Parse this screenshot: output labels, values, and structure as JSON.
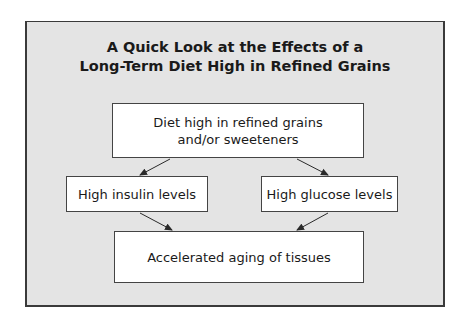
{
  "title": {
    "line1": "A Quick Look at the Effects of a",
    "line2": "Long-Term Diet High in Refined Grains"
  },
  "nodes": {
    "top": {
      "line1": "Diet high in refined grains",
      "line2": "and/or sweeteners"
    },
    "insulin": {
      "label": "High insulin levels"
    },
    "glucose": {
      "label": "High glucose levels"
    },
    "bottom": {
      "label": "Accelerated aging of tissues"
    }
  },
  "edges": [
    {
      "from": "top",
      "to": "insulin"
    },
    {
      "from": "top",
      "to": "glucose"
    },
    {
      "from": "insulin",
      "to": "bottom"
    },
    {
      "from": "glucose",
      "to": "bottom"
    }
  ],
  "colors": {
    "panel_bg": "#e4e4e4",
    "box_bg": "#ffffff",
    "border": "#3a3a3a",
    "text": "#1a1a1a"
  }
}
